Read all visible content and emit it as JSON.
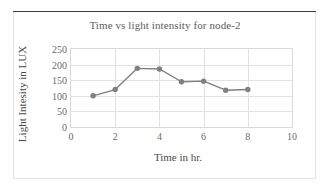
{
  "chart_data": {
    "type": "line",
    "title": "Time vs light intensity for node-2",
    "xlabel": "Time in hr.",
    "ylabel": "Light Intesity in LUX",
    "x": [
      1,
      2,
      3,
      4,
      5,
      6,
      7,
      8
    ],
    "values": [
      100,
      120,
      188,
      186,
      145,
      147,
      118,
      120
    ],
    "series": [
      {
        "name": "Light intensity",
        "values": [
          100,
          120,
          188,
          186,
          145,
          147,
          118,
          120
        ]
      }
    ],
    "xlim": [
      0,
      10
    ],
    "ylim": [
      0,
      250
    ],
    "xticks": [
      "0",
      "2",
      "4",
      "6",
      "8",
      "10"
    ],
    "xtick_values": [
      0,
      2,
      4,
      6,
      8,
      10
    ],
    "yticks": [
      "0",
      "50",
      "100",
      "150",
      "200",
      "250"
    ],
    "ytick_values": [
      0,
      50,
      100,
      150,
      200,
      250
    ],
    "grid": "horizontal-and-vertical",
    "legend": "none",
    "marker": "circle",
    "series_color": "#808080",
    "grid_color": "#e2e2e2",
    "axis_text_color": "#6a6a6a",
    "title_color": "#5e5e5e"
  }
}
